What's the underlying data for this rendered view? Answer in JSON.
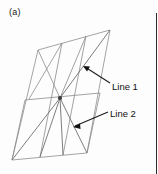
{
  "figure": {
    "panel_label": "(a)",
    "colors": {
      "mesh_edge": "#8a8a8a",
      "outline": "#9a9a9a",
      "spoke": "#6f6f6f",
      "leader": "#1b1b1b",
      "text": "#111111",
      "background": "#fdfdfd",
      "rule": "#2b2b2b"
    },
    "annotations": [
      {
        "id": "line-1",
        "label": "Line 1",
        "label_x": 112,
        "label_y": 87,
        "leader_from_x": 110,
        "leader_from_y": 83,
        "arrow_tip_x": 83,
        "arrow_tip_y": 66
      },
      {
        "id": "line-2",
        "label": "Line 2",
        "label_x": 110,
        "label_y": 114,
        "leader_from_x": 108,
        "leader_from_y": 112,
        "arrow_tip_x": 73,
        "arrow_tip_y": 127
      }
    ],
    "geometry": {
      "corners": {
        "top_left": [
          38,
          50
        ],
        "top_right": [
          110,
          30
        ],
        "bottom_right": [
          87,
          153
        ],
        "bottom_left": [
          12,
          160
        ]
      },
      "hub": [
        60,
        98
      ],
      "mid_line": [
        [
          25,
          100
        ],
        [
          100,
          93
        ]
      ]
    }
  }
}
